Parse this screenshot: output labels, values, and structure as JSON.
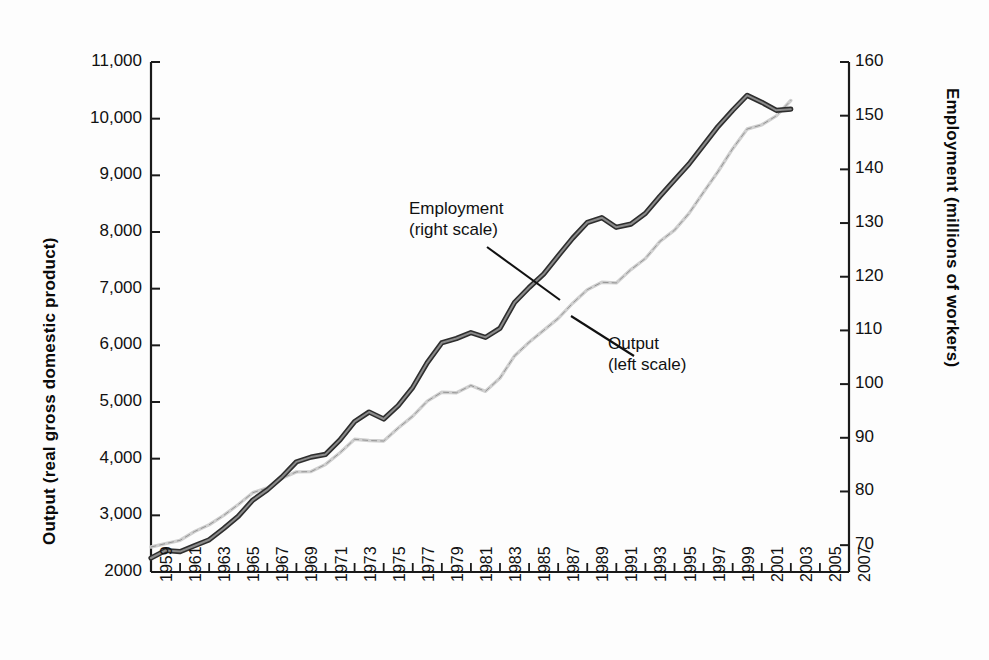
{
  "figure": {
    "background": "#fdfdfd",
    "axis_color": "#1a1a1a"
  },
  "axes": {
    "left": {
      "title": "Output  (real gross domestic product)",
      "ticks": [
        "11,000",
        "10,000",
        "9,000",
        "8,000",
        "7,000",
        "6,000",
        "5,000",
        "4,000",
        "3,000",
        "2000"
      ],
      "tick_values": [
        11000,
        10000,
        9000,
        8000,
        7000,
        6000,
        5000,
        4000,
        3000,
        2000
      ]
    },
    "right": {
      "title": "Employment (millions of workers)",
      "ticks": [
        "160",
        "150",
        "140",
        "130",
        "120",
        "110",
        "100",
        "90",
        "80",
        "70"
      ],
      "tick_values": [
        160,
        150,
        140,
        130,
        120,
        110,
        100,
        90,
        80,
        70
      ]
    },
    "bottom": {
      "ticks": [
        "1959",
        "1961",
        "1963",
        "1965",
        "1967",
        "1969",
        "1971",
        "1973",
        "1975",
        "1977",
        "1979",
        "1981",
        "1983",
        "1985",
        "1987",
        "1989",
        "1991",
        "1993",
        "1995",
        "1997",
        "1999",
        "2001",
        "2003",
        "2005",
        "2007"
      ],
      "tick_values": [
        1959,
        1961,
        1963,
        1965,
        1967,
        1969,
        1971,
        1973,
        1975,
        1977,
        1979,
        1981,
        1983,
        1985,
        1987,
        1989,
        1991,
        1993,
        1995,
        1997,
        1999,
        2001,
        2003,
        2005,
        2007
      ]
    }
  },
  "annotations": {
    "employment": {
      "line1": "Employment",
      "line2": "(right scale)"
    },
    "output": {
      "line1": "Output",
      "line2": "(left scale)"
    }
  },
  "chart_data": {
    "type": "line",
    "title": "",
    "xlabel": "",
    "ylabel": "Output  (real gross domestic product)",
    "y2label": "Employment (millions of workers)",
    "xlim": [
      1959,
      2007
    ],
    "ylim": [
      2000,
      11000
    ],
    "y2lim": [
      65,
      160
    ],
    "grid": false,
    "legend": "annotated-inline",
    "x": [
      1959,
      1960,
      1961,
      1962,
      1963,
      1964,
      1965,
      1966,
      1967,
      1968,
      1969,
      1970,
      1971,
      1972,
      1973,
      1974,
      1975,
      1976,
      1977,
      1978,
      1979,
      1980,
      1981,
      1982,
      1983,
      1984,
      1985,
      1986,
      1987,
      1988,
      1989,
      1990,
      1991,
      1992,
      1993,
      1994,
      1995,
      1996,
      1997,
      1998,
      1999,
      2000,
      2001,
      2002,
      2003
    ],
    "series": [
      {
        "name": "Employment",
        "axis": "right",
        "units": "millions of workers",
        "color": "#3b3b3b",
        "style": "solid",
        "values": [
          67.6,
          69.0,
          68.8,
          69.9,
          71.0,
          73.1,
          75.4,
          78.4,
          80.3,
          82.7,
          85.5,
          86.4,
          86.9,
          89.6,
          93.0,
          94.8,
          93.5,
          96.0,
          99.4,
          104.0,
          107.7,
          108.5,
          109.6,
          108.7,
          110.4,
          115.2,
          118.0,
          120.5,
          123.9,
          127.2,
          130.1,
          131.0,
          129.2,
          129.8,
          131.8,
          135.0,
          138.0,
          141.0,
          144.5,
          148.0,
          151.0,
          153.8,
          152.5,
          151.0,
          151.2
        ],
        "plotted_right_scale": [
          67.6,
          69.0,
          68.8,
          69.9,
          71.0,
          73.1,
          75.4,
          78.4,
          80.3,
          82.7,
          85.5,
          86.4,
          86.9,
          89.6,
          93.0,
          94.8,
          93.5,
          96.0,
          99.4,
          104.0,
          107.7,
          108.5,
          109.6,
          108.7,
          110.4,
          115.2,
          118.0,
          120.5,
          123.9,
          127.2,
          130.1,
          131.0,
          129.2,
          129.8,
          131.8,
          135.0,
          138.0,
          141.0,
          144.5,
          148.0,
          151.0,
          153.8,
          152.5,
          151.0,
          151.2
        ]
      },
      {
        "name": "Output",
        "axis": "left",
        "units": "billions of chained dollars",
        "color": "#c9c9c9",
        "style": "dashed",
        "values": [
          2442,
          2502,
          2560,
          2715,
          2834,
          2999,
          3192,
          3399,
          3485,
          3653,
          3766,
          3772,
          3899,
          4105,
          4342,
          4320,
          4311,
          4541,
          4751,
          5015,
          5173,
          5162,
          5292,
          5189,
          5424,
          5814,
          6054,
          6264,
          6475,
          6743,
          6981,
          7113,
          7101,
          7337,
          7533,
          7836,
          8032,
          8329,
          8704,
          9067,
          9470,
          9817,
          9891,
          10049,
          10320
        ],
        "plotted_left_scale": [
          2442,
          2502,
          2560,
          2715,
          2834,
          2999,
          3192,
          3399,
          3485,
          3653,
          3766,
          3772,
          3899,
          4105,
          4342,
          4320,
          4311,
          4541,
          4751,
          5015,
          5173,
          5162,
          5292,
          5189,
          5424,
          5814,
          6054,
          6264,
          6475,
          6743,
          6981,
          7113,
          7101,
          7337,
          7533,
          7836,
          8032,
          8329,
          8704,
          9067,
          9470,
          9817,
          9891,
          10049,
          10320
        ]
      }
    ]
  }
}
